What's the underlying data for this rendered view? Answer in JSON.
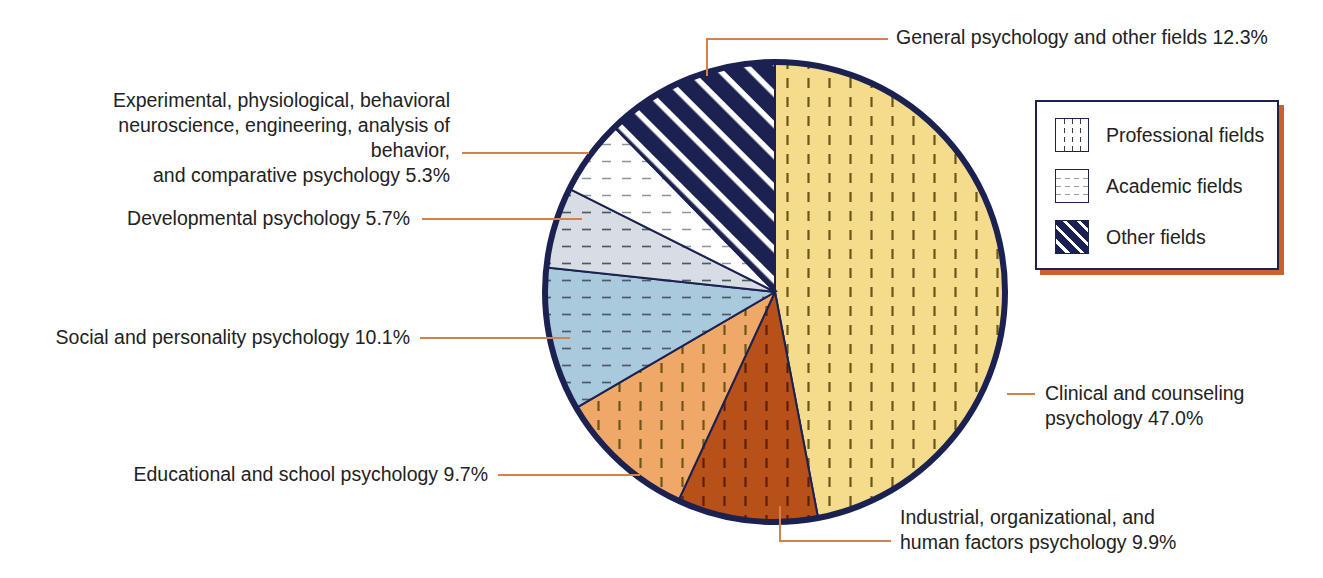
{
  "chart_data": {
    "type": "pie",
    "title": "",
    "subtitle": "",
    "xlabel": "",
    "ylabel": "",
    "grid": false,
    "legend_position": "right",
    "units": "percent",
    "categories": [
      "Clinical and counseling psychology",
      "Industrial, organizational, and human factors psychology",
      "Educational and school psychology",
      "Social and personality psychology",
      "Developmental psychology",
      "Experimental, physiological, behavioral neuroscience, engineering, analysis of behavior, and comparative psychology",
      "General psychology and other fields"
    ],
    "values": [
      47.0,
      9.9,
      9.7,
      10.1,
      5.7,
      5.3,
      12.3
    ],
    "groups": [
      "Professional fields",
      "Professional fields",
      "Professional fields",
      "Academic fields",
      "Academic fields",
      "Academic fields",
      "Other fields"
    ],
    "slice_colors": [
      "#f5dc8c",
      "#b8501a",
      "#f0a868",
      "#a9c9dc",
      "#d8dde4",
      "#ffffff",
      "#1b2252"
    ],
    "start_angle_deg": 0,
    "direction": "clockwise",
    "slices": [
      {
        "label": "Clinical and counseling psychology",
        "value": 47.0,
        "group": "Professional fields",
        "color": "#f5dc8c",
        "pattern": "vertical-dash"
      },
      {
        "label": "Industrial, organizational, and human factors psychology",
        "value": 9.9,
        "group": "Professional fields",
        "color": "#b8501a",
        "pattern": "vertical-dash"
      },
      {
        "label": "Educational and school psychology",
        "value": 9.7,
        "group": "Professional fields",
        "color": "#f0a868",
        "pattern": "vertical-dash"
      },
      {
        "label": "Social and personality psychology",
        "value": 10.1,
        "group": "Academic fields",
        "color": "#a9c9dc",
        "pattern": "horizontal-dash"
      },
      {
        "label": "Developmental psychology",
        "value": 5.7,
        "group": "Academic fields",
        "color": "#d8dde4",
        "pattern": "horizontal-dash"
      },
      {
        "label": "Experimental, physiological, behavioral neuroscience, engineering, analysis of behavior, and comparative psychology",
        "value": 5.3,
        "group": "Academic fields",
        "color": "#ffffff",
        "pattern": "horizontal-dash"
      },
      {
        "label": "General psychology and other fields",
        "value": 12.3,
        "group": "Other fields",
        "color": "#1b2252",
        "pattern": "diagonal-stripe"
      }
    ]
  },
  "callouts": {
    "general": "General psychology and other fields 12.3%",
    "experimental": "Experimental, physiological, behavioral\nneuroscience, engineering, analysis of behavior,\nand comparative psychology 5.3%",
    "developmental": "Developmental psychology 5.7%",
    "social": "Social and personality psychology 10.1%",
    "educational": "Educational and school psychology 9.7%",
    "clinical": "Clinical and counseling\npsychology 47.0%",
    "industrial": "Industrial, organizational, and\nhuman factors psychology 9.9%"
  },
  "legend": {
    "items": [
      {
        "label": "Professional fields",
        "pattern": "vertical-dash",
        "color": "#ffffff"
      },
      {
        "label": "Academic fields",
        "pattern": "horizontal-dash",
        "color": "#ffffff"
      },
      {
        "label": "Other fields",
        "pattern": "diagonal-stripe",
        "color": "#1b2252"
      }
    ],
    "border_color": "#1b2252",
    "shadow_color": "#c9622c"
  },
  "style": {
    "pie_outline_color": "#1b2252",
    "leader_line_color": "#d5824a",
    "text_color": "#222222",
    "background": "#ffffff"
  }
}
